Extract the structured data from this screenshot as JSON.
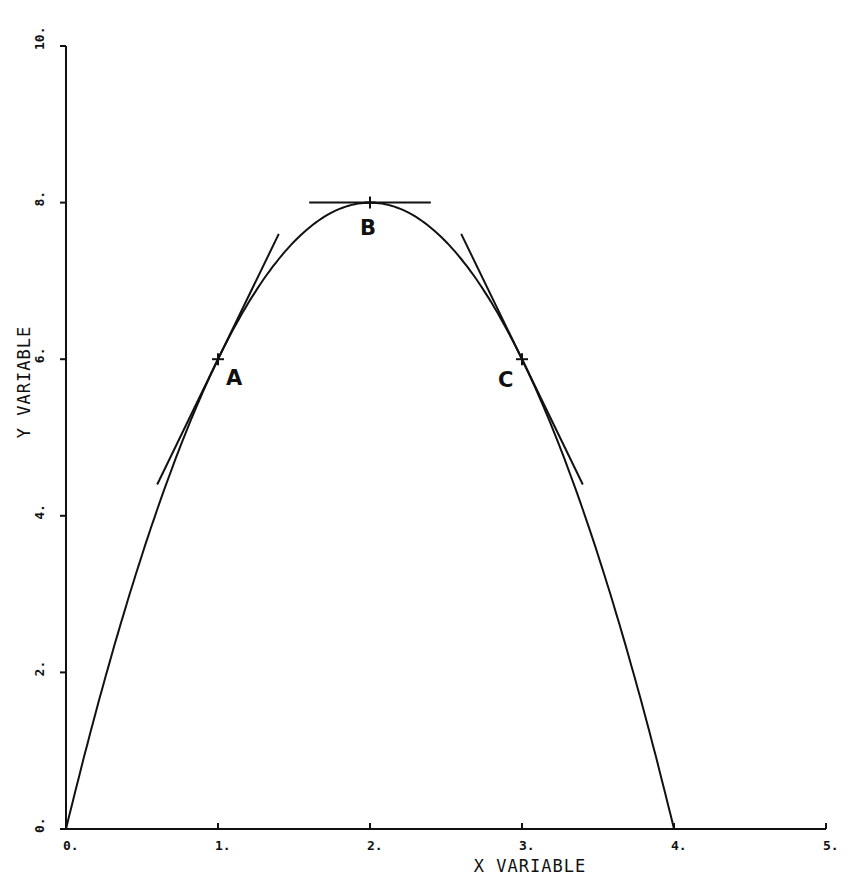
{
  "chart_data": {
    "type": "line",
    "title": "",
    "xlabel": "X VARIABLE",
    "ylabel": "Y VARIABLE",
    "xlim": [
      0,
      5
    ],
    "ylim": [
      0,
      10
    ],
    "grid": false,
    "x_ticks": [
      "0.",
      "1.",
      "2.",
      "3.",
      "4.",
      "5."
    ],
    "y_ticks": [
      "0.",
      "2.",
      "4.",
      "6.",
      "8.",
      "10."
    ],
    "series": [
      {
        "name": "curve y = 8x - 2x^2",
        "x": [
          0,
          0.5,
          1,
          1.5,
          2,
          2.5,
          3,
          3.5,
          4
        ],
        "y": [
          0,
          3.5,
          6,
          7.5,
          8,
          7.5,
          6,
          3.5,
          0
        ]
      },
      {
        "name": "tangent at A (slope 4)",
        "x": [
          0.6,
          1.4
        ],
        "y": [
          4.4,
          7.6
        ]
      },
      {
        "name": "tangent at B (slope 0)",
        "x": [
          1.6,
          2.4
        ],
        "y": [
          8,
          8
        ]
      },
      {
        "name": "tangent at C (slope -4)",
        "x": [
          2.6,
          3.4
        ],
        "y": [
          7.6,
          4.4
        ]
      }
    ],
    "annotations": [
      {
        "label": "A",
        "x": 1,
        "y": 6
      },
      {
        "label": "B",
        "x": 2,
        "y": 8
      },
      {
        "label": "C",
        "x": 3,
        "y": 6
      }
    ]
  }
}
